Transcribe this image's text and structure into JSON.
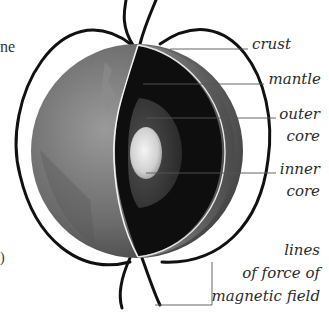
{
  "diagram": {
    "labels": {
      "crust": "crust",
      "mantle": "mantle",
      "outer_core_1": "outer",
      "outer_core_2": "core",
      "inner_core_1": "inner",
      "inner_core_2": "core",
      "field_1": "lines",
      "field_2": "of force of",
      "field_3": "magnetic field"
    },
    "left_fragments": {
      "top": "ne",
      "bottom": ")"
    },
    "colors": {
      "background": "#ffffff",
      "field_lines": "#111111",
      "leader_lines": "#555555",
      "label_text": "#2b2b2b",
      "mantle": "#0e0e0e",
      "outer_core": "#3a3a3a",
      "inner_core": "#d8d8d8",
      "globe_surface": "#6e6e6e"
    }
  }
}
